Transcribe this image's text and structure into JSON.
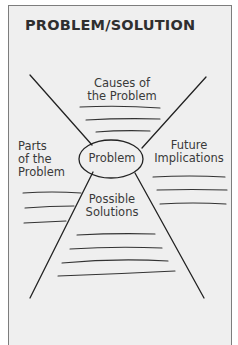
{
  "title": "PROBLEM/SOLUTION",
  "diagram": {
    "center": {
      "label": "Problem"
    },
    "sections": [
      {
        "id": "top",
        "label_lines": [
          "Causes of",
          "the Problem"
        ],
        "answer_lines": 3
      },
      {
        "id": "left",
        "label_lines": [
          "Parts",
          "of the",
          "Problem"
        ],
        "answer_lines": 3
      },
      {
        "id": "right",
        "label_lines": [
          "Future",
          "Implications"
        ],
        "answer_lines": 3
      },
      {
        "id": "bottom",
        "label_lines": [
          "Possible",
          "Solutions"
        ],
        "answer_lines": 4
      }
    ]
  },
  "colors": {
    "ink": "#222222",
    "text": "#3a3a3a",
    "frame_bg": "#efefef",
    "frame_border": "#7d7d7d"
  }
}
